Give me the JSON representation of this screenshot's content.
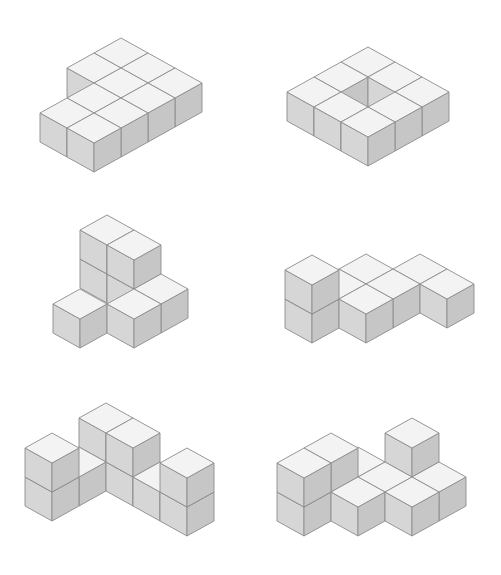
{
  "diagram": {
    "title": "",
    "colors": {
      "background": "#ffffff",
      "top_face": "#f3f3f3",
      "left_face": "#d6d6d6",
      "right_face": "#c6c6c6",
      "edge": "#8c8c8c"
    },
    "projection": {
      "half_width": 27,
      "half_rise": 15,
      "cube_height": 29
    },
    "figures": [
      {
        "name": "figure-1",
        "origin": [
          121,
          38
        ],
        "cubes": [
          [
            0,
            0,
            0
          ],
          [
            1,
            0,
            0
          ],
          [
            2,
            0,
            0
          ],
          [
            0,
            1,
            0
          ],
          [
            1,
            1,
            0
          ],
          [
            2,
            1,
            0
          ],
          [
            1,
            2,
            0
          ],
          [
            2,
            2,
            0
          ],
          [
            1,
            3,
            0
          ],
          [
            2,
            3,
            0
          ]
        ]
      },
      {
        "name": "figure-2",
        "origin": [
          368,
          47
        ],
        "cubes": [
          [
            0,
            0,
            0
          ],
          [
            1,
            0,
            0
          ],
          [
            2,
            0,
            0
          ],
          [
            0,
            1,
            0
          ],
          [
            2,
            1,
            0
          ],
          [
            0,
            2,
            0
          ],
          [
            1,
            2,
            0
          ],
          [
            2,
            2,
            0
          ]
        ]
      },
      {
        "name": "figure-3",
        "origin": [
          107,
          244
        ],
        "cubes": [
          [
            0,
            0,
            0
          ],
          [
            0,
            0,
            1
          ],
          [
            1,
            0,
            0
          ],
          [
            1,
            0,
            1
          ],
          [
            2,
            0,
            0
          ],
          [
            2,
            1,
            0
          ],
          [
            1,
            2,
            0
          ]
        ]
      },
      {
        "name": "figure-4",
        "origin": [
          312,
          284
        ],
        "cubes": [
          [
            0,
            -2,
            0
          ],
          [
            1,
            -3,
            0
          ],
          [
            0,
            -1,
            0
          ],
          [
            1,
            -2,
            0
          ],
          [
            2,
            -3,
            0
          ],
          [
            0,
            0,
            0
          ],
          [
            0,
            0,
            1
          ],
          [
            1,
            -1,
            0
          ]
        ]
      },
      {
        "name": "figure-5",
        "origin": [
          106,
          432
        ],
        "cubes": [
          [
            0,
            0,
            0
          ],
          [
            0,
            0,
            1
          ],
          [
            1,
            0,
            0
          ],
          [
            1,
            0,
            1
          ],
          [
            0,
            1,
            0
          ],
          [
            2,
            0,
            0
          ],
          [
            3,
            0,
            0
          ],
          [
            3,
            0,
            1
          ],
          [
            0,
            2,
            0
          ],
          [
            0,
            2,
            1
          ]
        ]
      },
      {
        "name": "figure-6",
        "origin": [
          412,
          447
        ],
        "cubes": [
          [
            0,
            0,
            0
          ],
          [
            0,
            0,
            1
          ],
          [
            1,
            0,
            0
          ],
          [
            -1,
            1,
            0
          ],
          [
            0,
            1,
            0
          ],
          [
            1,
            1,
            0
          ],
          [
            -1,
            2,
            0
          ],
          [
            -1,
            2,
            1
          ],
          [
            0,
            2,
            0
          ],
          [
            -1,
            3,
            0
          ],
          [
            -1,
            3,
            1
          ]
        ]
      }
    ]
  }
}
